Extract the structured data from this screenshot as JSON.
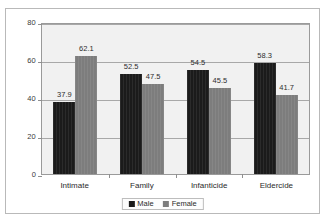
{
  "chart_data": {
    "type": "bar",
    "title": "",
    "subtitle": "",
    "xlabel": "",
    "ylabel": "",
    "categories": [
      "Intimate",
      "Family",
      "Infanticide",
      "Eldercide"
    ],
    "series": [
      {
        "name": "Male",
        "color": "#1b1b1b",
        "values": [
          37.9,
          52.5,
          54.5,
          58.3
        ]
      },
      {
        "name": "Female",
        "color": "#7d7d7d",
        "values": [
          62.1,
          47.5,
          45.5,
          41.7
        ]
      }
    ],
    "ylim": [
      0,
      80
    ],
    "yticks": [
      0,
      20,
      40,
      60,
      80
    ],
    "ytick_labels": [
      "0",
      "20",
      "40",
      "60",
      "80"
    ],
    "grid": true,
    "legend_position": "bottom",
    "data_labels": [
      [
        "37.9",
        "62.1"
      ],
      [
        "52.5",
        "47.5"
      ],
      [
        "54.5",
        "45.5"
      ],
      [
        "58.3",
        "41.7"
      ]
    ]
  }
}
